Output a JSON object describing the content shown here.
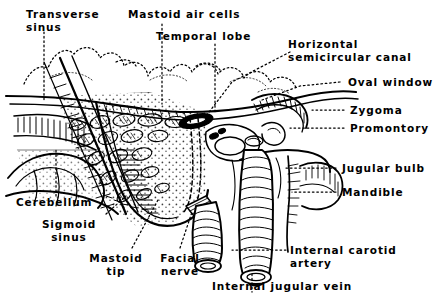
{
  "figure": {
    "type": "anatomical-line-drawing",
    "style": "black-and-white pen-and-ink hatched illustration",
    "background_color": "#ffffff",
    "ink_color": "#000000",
    "leader_line_style": "dotted"
  },
  "labels": [
    {
      "id": "transverse-sinus",
      "text": "Transverse\nsinus",
      "align": "left"
    },
    {
      "id": "mastoid-air-cells",
      "text": "Mastoid air cells",
      "align": "left"
    },
    {
      "id": "temporal-lobe",
      "text": "Temporal lobe",
      "align": "left"
    },
    {
      "id": "horizontal-semicircular-canal",
      "text": "Horizontal\nsemicircular canal",
      "align": "left"
    },
    {
      "id": "oval-window",
      "text": "Oval window",
      "align": "left"
    },
    {
      "id": "zygoma",
      "text": "Zygoma",
      "align": "left"
    },
    {
      "id": "promontory",
      "text": "Promontory",
      "align": "left"
    },
    {
      "id": "jugular-bulb",
      "text": "Jugular bulb",
      "align": "left"
    },
    {
      "id": "mandible",
      "text": "Mandible",
      "align": "left"
    },
    {
      "id": "internal-carotid-artery",
      "text": "Internal carotid\nartery",
      "align": "left"
    },
    {
      "id": "internal-jugular-vein",
      "text": "Internal jugular vein",
      "align": "left"
    },
    {
      "id": "facial-nerve",
      "text": "Facial\nnerve",
      "align": "center"
    },
    {
      "id": "mastoid-tip",
      "text": "Mastoid\ntip",
      "align": "center"
    },
    {
      "id": "sigmoid-sinus",
      "text": "Sigmoid\nsinus",
      "align": "center"
    },
    {
      "id": "cerebellum",
      "text": "Cerebellum",
      "align": "left"
    }
  ]
}
